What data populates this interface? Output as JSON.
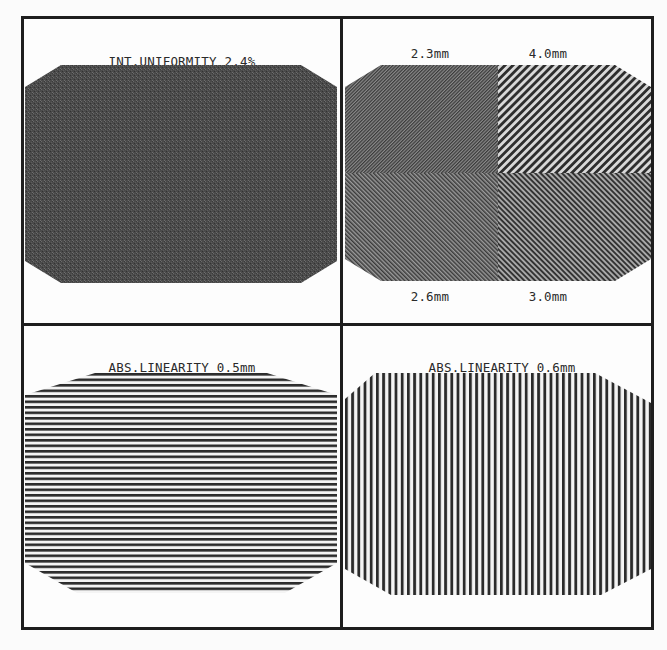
{
  "panels": {
    "intrinsic_uniformity": {
      "line1": "INT.UNIFORMITY 2.4%",
      "line2": "DIF.UNIFORMITY 1.7%"
    },
    "bar_phantom": {
      "top_left_label": "2.3mm",
      "top_right_label": "4.0mm",
      "bottom_left_label": "2.6mm",
      "bottom_right_label": "3.0mm"
    },
    "linearity_horizontal": {
      "line1": "ABS.LINEARITY 0.5mm",
      "line2": "DIF.LINEARITY 0.2mm"
    },
    "linearity_vertical": {
      "line1": "ABS.LINEARITY 0.6mm",
      "line2": "DIF.LINEARITY 0.2mm"
    }
  },
  "colors": {
    "frame": "#1e1e1e",
    "flood_fill": "#4a4a4a",
    "bars": "#2b2b2b",
    "background": "#fdfdfd"
  }
}
